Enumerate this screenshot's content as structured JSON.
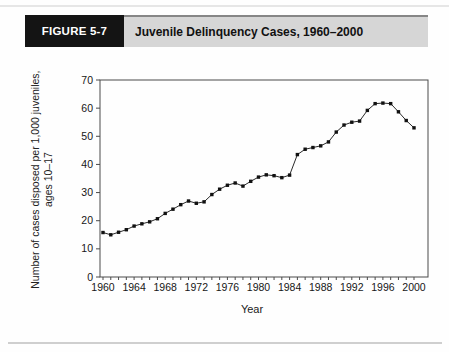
{
  "figure": {
    "label": "FIGURE 5-7",
    "title": "Juvenile Delinquency Cases, 1960–2000"
  },
  "chart_data": {
    "type": "line",
    "title": "Juvenile Delinquency Cases, 1960–2000",
    "xlabel": "Year",
    "ylabel": "Number of cases disposed per 1,000 juveniles, ages 10–17",
    "ylabel_line1": "Number of cases disposed per 1,000 juveniles,",
    "ylabel_line2": "ages 10–17",
    "x": [
      1960,
      1961,
      1962,
      1963,
      1964,
      1965,
      1966,
      1967,
      1968,
      1969,
      1970,
      1971,
      1972,
      1973,
      1974,
      1975,
      1976,
      1977,
      1978,
      1979,
      1980,
      1981,
      1982,
      1983,
      1984,
      1985,
      1986,
      1987,
      1988,
      1989,
      1990,
      1991,
      1992,
      1993,
      1994,
      1995,
      1996,
      1997,
      1998,
      1999,
      2000
    ],
    "values": [
      15.8,
      15.0,
      15.9,
      16.8,
      18.1,
      18.9,
      19.6,
      20.7,
      22.6,
      24.1,
      25.7,
      27.0,
      26.2,
      26.7,
      29.3,
      31.2,
      32.6,
      33.4,
      32.3,
      34.0,
      35.5,
      36.3,
      36.0,
      35.3,
      36.2,
      43.5,
      45.4,
      46.0,
      46.6,
      48.0,
      51.5,
      54.0,
      55.0,
      55.4,
      59.2,
      61.6,
      61.8,
      61.6,
      58.7,
      55.6,
      53.0
    ],
    "ylim": [
      0,
      70
    ],
    "xlim": [
      1960,
      2000
    ],
    "y_ticks": [
      0,
      10,
      20,
      30,
      40,
      50,
      60,
      70
    ],
    "x_tick_labels": [
      "1960",
      "1964",
      "1968",
      "1972",
      "1976",
      "1980",
      "1984",
      "1988",
      "1992",
      "1996",
      "2000"
    ],
    "grid": false,
    "legend": "none",
    "marker": "square",
    "line_color": "#2a2a2a",
    "marker_color": "#111111",
    "axis_color": "#4a4a4a"
  }
}
